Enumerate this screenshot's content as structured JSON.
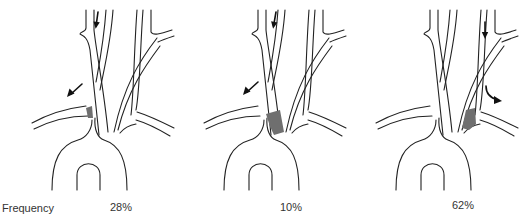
{
  "figure": {
    "row_label": "Frequency",
    "panels": [
      {
        "id": "panel-1",
        "frequency": "28%",
        "shaded_region": "right-subclavian-origin",
        "arrows": [
          "down-right-vertebral",
          "left-subclavian-outflow"
        ]
      },
      {
        "id": "panel-2",
        "frequency": "10%",
        "shaded_region": "brachiocephalic-trunk",
        "arrows": [
          "down-right-vertebral",
          "left-subclavian-outflow"
        ]
      },
      {
        "id": "panel-3",
        "frequency": "62%",
        "shaded_region": "left-subclavian-origin",
        "arrows": [
          "down-left-vertebral",
          "right-subclavian-outflow"
        ]
      }
    ]
  },
  "colors": {
    "line": "#222222",
    "shade": "#6f6f6f",
    "background": "#ffffff"
  }
}
